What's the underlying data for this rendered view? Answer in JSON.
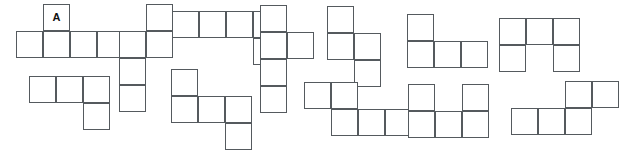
{
  "canvas": {
    "width": 607,
    "height": 131,
    "background": "#ffffff",
    "stroke_color": "#555a5e",
    "stroke_width": 1.5,
    "cell_size": 27
  },
  "figure": {
    "type": "polyomino-nets-grid",
    "label_text": "A",
    "rows": 2,
    "shape_count": 12
  },
  "shapes": [
    {
      "id": "shape-1",
      "name": "row1-shape-1",
      "row": 1,
      "index": 1,
      "origin_x": 16,
      "origin_y": 4,
      "square_count": 5,
      "cells": [
        {
          "col": 1,
          "row": 0,
          "label": "A"
        },
        {
          "col": 0,
          "row": 1,
          "label": ""
        },
        {
          "col": 1,
          "row": 1,
          "label": ""
        },
        {
          "col": 2,
          "row": 1,
          "label": ""
        },
        {
          "col": 3,
          "row": 1,
          "label": ""
        }
      ]
    },
    {
      "id": "shape-2",
      "name": "row1-shape-2",
      "row": 1,
      "index": 2,
      "origin_x": 119,
      "origin_y": 4,
      "square_count": 5,
      "cells": [
        {
          "col": 1,
          "row": 0,
          "label": ""
        },
        {
          "col": 0,
          "row": 1,
          "label": ""
        },
        {
          "col": 1,
          "row": 1,
          "label": ""
        },
        {
          "col": 0,
          "row": 2,
          "label": ""
        },
        {
          "col": 0,
          "row": 3,
          "label": ""
        }
      ]
    },
    {
      "id": "shape-3",
      "name": "row1-shape-3",
      "row": 1,
      "index": 3,
      "origin_x": 172,
      "origin_y": 11,
      "square_count": 5,
      "cells": [
        {
          "col": 0,
          "row": 0,
          "label": ""
        },
        {
          "col": 1,
          "row": 0,
          "label": ""
        },
        {
          "col": 2,
          "row": 0,
          "label": ""
        },
        {
          "col": 3,
          "row": 0,
          "label": ""
        },
        {
          "col": 3,
          "row": 1,
          "label": ""
        }
      ]
    },
    {
      "id": "shape-4",
      "name": "row1-shape-4",
      "row": 1,
      "index": 4,
      "origin_x": 260,
      "origin_y": 5,
      "square_count": 5,
      "cells": [
        {
          "col": 0,
          "row": 0,
          "label": ""
        },
        {
          "col": 0,
          "row": 1,
          "label": ""
        },
        {
          "col": 1,
          "row": 1,
          "label": ""
        },
        {
          "col": 0,
          "row": 2,
          "label": ""
        },
        {
          "col": 0,
          "row": 3,
          "label": ""
        }
      ]
    },
    {
      "id": "shape-5",
      "name": "row1-shape-5",
      "row": 1,
      "index": 5,
      "origin_x": 327,
      "origin_y": 6,
      "square_count": 4,
      "cells": [
        {
          "col": 0,
          "row": 0,
          "label": ""
        },
        {
          "col": 0,
          "row": 1,
          "label": ""
        },
        {
          "col": 1,
          "row": 1,
          "label": ""
        },
        {
          "col": 1,
          "row": 2,
          "label": ""
        }
      ]
    },
    {
      "id": "shape-6",
      "name": "row1-shape-6",
      "row": 1,
      "index": 6,
      "origin_x": 407,
      "origin_y": 14,
      "square_count": 4,
      "cells": [
        {
          "col": 0,
          "row": 0,
          "label": ""
        },
        {
          "col": 0,
          "row": 1,
          "label": ""
        },
        {
          "col": 1,
          "row": 1,
          "label": ""
        },
        {
          "col": 2,
          "row": 1,
          "label": ""
        }
      ]
    },
    {
      "id": "shape-7",
      "name": "row1-shape-7",
      "row": 1,
      "index": 7,
      "origin_x": 499,
      "origin_y": 18,
      "square_count": 5,
      "cells": [
        {
          "col": 0,
          "row": 0,
          "label": ""
        },
        {
          "col": 1,
          "row": 0,
          "label": ""
        },
        {
          "col": 2,
          "row": 0,
          "label": ""
        },
        {
          "col": 0,
          "row": 1,
          "label": ""
        },
        {
          "col": 2,
          "row": 1,
          "label": ""
        }
      ]
    },
    {
      "id": "shape-8",
      "name": "row2-shape-1",
      "row": 2,
      "index": 1,
      "origin_x": 29,
      "origin_y": 76,
      "square_count": 4,
      "cells": [
        {
          "col": 0,
          "row": 0,
          "label": ""
        },
        {
          "col": 1,
          "row": 0,
          "label": ""
        },
        {
          "col": 2,
          "row": 0,
          "label": ""
        },
        {
          "col": 2,
          "row": 1,
          "label": ""
        }
      ]
    },
    {
      "id": "shape-9",
      "name": "row2-shape-2",
      "row": 2,
      "index": 2,
      "origin_x": 171,
      "origin_y": 69,
      "square_count": 5,
      "cells": [
        {
          "col": 0,
          "row": 0,
          "label": ""
        },
        {
          "col": 0,
          "row": 1,
          "label": ""
        },
        {
          "col": 1,
          "row": 1,
          "label": ""
        },
        {
          "col": 2,
          "row": 1,
          "label": ""
        },
        {
          "col": 2,
          "row": 2,
          "label": ""
        }
      ]
    },
    {
      "id": "shape-10",
      "name": "row2-shape-3",
      "row": 2,
      "index": 3,
      "origin_x": 304,
      "origin_y": 82,
      "square_count": 5,
      "cells": [
        {
          "col": 0,
          "row": 0,
          "label": ""
        },
        {
          "col": 1,
          "row": 0,
          "label": ""
        },
        {
          "col": 1,
          "row": 1,
          "label": ""
        },
        {
          "col": 2,
          "row": 1,
          "label": ""
        },
        {
          "col": 3,
          "row": 1,
          "label": ""
        }
      ]
    },
    {
      "id": "shape-11",
      "name": "row2-shape-4",
      "row": 2,
      "index": 4,
      "origin_x": 408,
      "origin_y": 84,
      "square_count": 5,
      "cells": [
        {
          "col": 0,
          "row": 0,
          "label": ""
        },
        {
          "col": 2,
          "row": 0,
          "label": ""
        },
        {
          "col": 0,
          "row": 1,
          "label": ""
        },
        {
          "col": 1,
          "row": 1,
          "label": ""
        },
        {
          "col": 2,
          "row": 1,
          "label": ""
        }
      ]
    },
    {
      "id": "shape-12",
      "name": "row2-shape-5",
      "row": 2,
      "index": 5,
      "origin_x": 511,
      "origin_y": 81,
      "square_count": 5,
      "cells": [
        {
          "col": 2,
          "row": 0,
          "label": ""
        },
        {
          "col": 3,
          "row": 0,
          "label": ""
        },
        {
          "col": 0,
          "row": 1,
          "label": ""
        },
        {
          "col": 1,
          "row": 1,
          "label": ""
        },
        {
          "col": 2,
          "row": 1,
          "label": ""
        }
      ]
    }
  ]
}
